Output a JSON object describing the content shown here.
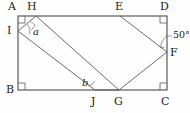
{
  "figure": {
    "stroke_color": "#4a4a4a",
    "text_color": "#1a1a1a",
    "background": "#fefefe"
  },
  "vertices": {
    "A": {
      "label": "A",
      "x": 18,
      "y": 16
    },
    "B": {
      "label": "B",
      "x": 18,
      "y": 90
    },
    "C": {
      "label": "C",
      "x": 167,
      "y": 90
    },
    "D": {
      "label": "D",
      "x": 167,
      "y": 16
    },
    "E": {
      "label": "E",
      "x": 120,
      "y": 16
    },
    "F": {
      "label": "F",
      "x": 167,
      "y": 52
    },
    "G": {
      "label": "G",
      "x": 119,
      "y": 90
    },
    "H": {
      "label": "H",
      "x": 36,
      "y": 16
    },
    "I": {
      "label": "I",
      "x": 18,
      "y": 31
    },
    "J": {
      "label": "J",
      "x": 95,
      "y": 90
    }
  },
  "labels": [
    {
      "name": "vertex-label-A",
      "text": "A",
      "x": 8,
      "y": 2
    },
    {
      "name": "vertex-label-H",
      "text": "H",
      "x": 27,
      "y": 2
    },
    {
      "name": "vertex-label-E",
      "text": "E",
      "x": 115,
      "y": 2
    },
    {
      "name": "vertex-label-D",
      "text": "D",
      "x": 160,
      "y": 2
    },
    {
      "name": "vertex-label-I",
      "text": "I",
      "x": 7,
      "y": 26
    },
    {
      "name": "vertex-label-F",
      "text": "F",
      "x": 170,
      "y": 50
    },
    {
      "name": "vertex-label-B",
      "text": "B",
      "x": 6,
      "y": 85
    },
    {
      "name": "vertex-label-J",
      "text": "J",
      "x": 91,
      "y": 97
    },
    {
      "name": "vertex-label-G",
      "text": "G",
      "x": 115,
      "y": 97
    },
    {
      "name": "vertex-label-C",
      "text": "C",
      "x": 161,
      "y": 97
    }
  ],
  "angle_labels": [
    {
      "name": "angle-label-a",
      "text": "a",
      "x": 33,
      "y": 28,
      "style": "italic"
    },
    {
      "name": "angle-label-b",
      "text": "b",
      "x": 83,
      "y": 80,
      "style": "italic"
    }
  ],
  "measured_angles": [
    {
      "name": "angle-measure-50",
      "text": "50°",
      "x": 173,
      "y": 33,
      "value": 50,
      "unit": "degrees"
    }
  ],
  "segments": [
    {
      "name": "side-AB",
      "from": "A",
      "to": "B"
    },
    {
      "name": "side-BC",
      "from": "B",
      "to": "C"
    },
    {
      "name": "side-CD",
      "from": "C",
      "to": "D"
    },
    {
      "name": "side-DA",
      "from": "D",
      "to": "A"
    },
    {
      "name": "fold-H-G",
      "from": "H",
      "to": "G"
    },
    {
      "name": "fold-I-J",
      "from": "I",
      "to": "J"
    },
    {
      "name": "fold-H-I",
      "from": "H",
      "to": "I"
    },
    {
      "name": "fold-G-J",
      "from": "G",
      "to": "J"
    },
    {
      "name": "fold-E-F",
      "from": "E",
      "to": "F"
    },
    {
      "name": "fold-F-G",
      "from": "F",
      "to": "G"
    }
  ],
  "right_angle_marks": [
    {
      "name": "right-angle-mark-A",
      "x": 19,
      "y": 17
    },
    {
      "name": "right-angle-mark-B",
      "x": 19,
      "y": 83
    },
    {
      "name": "right-angle-mark-C",
      "x": 159,
      "y": 83
    },
    {
      "name": "right-angle-mark-D",
      "x": 159,
      "y": 17
    }
  ],
  "arcs": [
    {
      "name": "angle-arc-a",
      "at": "I",
      "label": "a"
    },
    {
      "name": "angle-arc-b",
      "at": "J",
      "label": "b"
    },
    {
      "name": "angle-arc-50",
      "at": "F",
      "label": "50°"
    }
  ]
}
